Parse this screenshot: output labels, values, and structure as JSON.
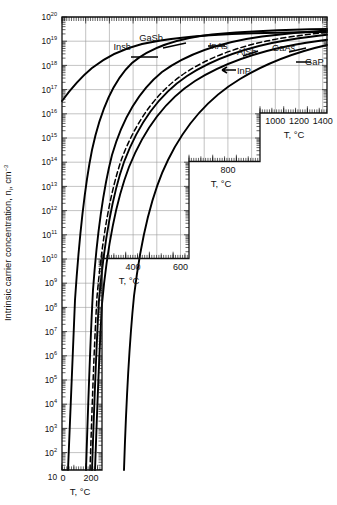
{
  "figure": {
    "kind": "semilog-chart",
    "background": "#ffffff",
    "ink": "#000000",
    "grid_color": "#9a9a9a"
  },
  "axes": {
    "y_title_main": "Intrinsic carrier concentration, n",
    "y_title_sub": "i",
    "y_title_unit": ", cm",
    "y_title_unit_sup": "−3",
    "y_scale": "log",
    "y_labels": [
      {
        "mant": "10",
        "exp": "20"
      },
      {
        "mant": "10",
        "exp": "19"
      },
      {
        "mant": "10",
        "exp": "18"
      },
      {
        "mant": "10",
        "exp": "17"
      },
      {
        "mant": "10",
        "exp": "16"
      },
      {
        "mant": "10",
        "exp": "15"
      },
      {
        "mant": "10",
        "exp": "14"
      },
      {
        "mant": "10",
        "exp": "13"
      },
      {
        "mant": "10",
        "exp": "12"
      },
      {
        "mant": "10",
        "exp": "11"
      },
      {
        "mant": "10",
        "exp": "10"
      },
      {
        "mant": "10",
        "exp": "9"
      },
      {
        "mant": "10",
        "exp": "8"
      },
      {
        "mant": "10",
        "exp": "7"
      },
      {
        "mant": "10",
        "exp": "6"
      },
      {
        "mant": "10",
        "exp": "5"
      },
      {
        "mant": "10",
        "exp": "4"
      },
      {
        "mant": "10",
        "exp": "3"
      },
      {
        "mant": "10",
        "exp": "2"
      },
      {
        "mant": "10",
        "exp": ""
      }
    ],
    "x_axis_title": "T, °C",
    "x_panels": [
      {
        "name": "panel-1000-1400",
        "ticks": [
          "1000",
          "1200",
          "1400"
        ],
        "title": "T, °C"
      },
      {
        "name": "panel-800",
        "ticks": [
          "800"
        ],
        "title": "T, °C"
      },
      {
        "name": "panel-400-600",
        "ticks": [
          "400",
          "600"
        ],
        "title": "T, °C"
      },
      {
        "name": "panel-0-200",
        "ticks": [
          "0",
          "200"
        ],
        "title": "T, °C"
      }
    ]
  },
  "curve_labels": [
    {
      "id": "insb",
      "text": "Insb"
    },
    {
      "id": "gasb",
      "text": "GaSb"
    },
    {
      "id": "inas",
      "text": "InAs"
    },
    {
      "id": "alsb",
      "text": "AlSb"
    },
    {
      "id": "gaas",
      "text": "GaAs"
    },
    {
      "id": "inp",
      "text": "InP"
    },
    {
      "id": "gap",
      "text": "GaP"
    }
  ],
  "chart_data": {
    "type": "line",
    "title": "",
    "xlabel": "T, °C",
    "ylabel": "Intrinsic carrier concentration, n_i, cm^-3",
    "xlim": [
      0,
      1500
    ],
    "ylim": [
      10,
      1e+20
    ],
    "yscale": "log",
    "grid": true,
    "legend": "inline-labels",
    "xticks": [
      0,
      200,
      400,
      600,
      800,
      1000,
      1200,
      1400
    ],
    "yticks": [
      10,
      100,
      1000,
      10000,
      100000,
      1000000,
      10000000,
      100000000,
      1000000000.0,
      10000000000.0,
      100000000000.0,
      1000000000000.0,
      10000000000000.0,
      100000000000000.0,
      1000000000000000.0,
      1e+16,
      1e+17,
      1e+18,
      1e+19,
      1e+20
    ],
    "series": [
      {
        "name": "Insb",
        "style": "solid",
        "points": [
          [
            0,
            14.8
          ],
          [
            20,
            15.6
          ],
          [
            60,
            16.4
          ],
          [
            100,
            16.9
          ],
          [
            150,
            17.3
          ],
          [
            200,
            17.6
          ],
          [
            300,
            18.0
          ],
          [
            400,
            18.3
          ],
          [
            500,
            18.5
          ],
          [
            600,
            18.65
          ],
          [
            700,
            18.75
          ],
          [
            800,
            18.85
          ]
        ]
      },
      {
        "name": "GaSb",
        "style": "solid",
        "points": [
          [
            0,
            11.6
          ],
          [
            50,
            12.9
          ],
          [
            100,
            13.9
          ],
          [
            150,
            14.7
          ],
          [
            200,
            15.4
          ],
          [
            300,
            16.4
          ],
          [
            400,
            17.1
          ],
          [
            500,
            17.6
          ],
          [
            600,
            17.95
          ],
          [
            700,
            18.2
          ],
          [
            800,
            18.4
          ],
          [
            900,
            18.55
          ],
          [
            1000,
            18.65
          ],
          [
            1100,
            18.75
          ]
        ]
      },
      {
        "name": "InAs",
        "style": "solid",
        "points": [
          [
            0,
            9.0
          ],
          [
            50,
            10.8
          ],
          [
            100,
            12.1
          ],
          [
            150,
            13.1
          ],
          [
            200,
            13.9
          ],
          [
            300,
            15.1
          ],
          [
            400,
            15.95
          ],
          [
            500,
            16.6
          ],
          [
            600,
            17.05
          ],
          [
            700,
            17.4
          ],
          [
            800,
            17.7
          ],
          [
            900,
            17.9
          ],
          [
            1000,
            18.1
          ],
          [
            1100,
            18.25
          ],
          [
            1200,
            18.4
          ],
          [
            1300,
            18.5
          ],
          [
            1400,
            18.6
          ]
        ]
      },
      {
        "name": "AlSb",
        "style": "solid",
        "points": [
          [
            100,
            5.4
          ],
          [
            150,
            6.9
          ],
          [
            200,
            8.1
          ],
          [
            300,
            10.0
          ],
          [
            400,
            11.4
          ],
          [
            500,
            12.5
          ],
          [
            600,
            13.4
          ],
          [
            700,
            14.1
          ],
          [
            800,
            14.7
          ],
          [
            900,
            15.2
          ],
          [
            1000,
            15.7
          ],
          [
            1100,
            16.1
          ],
          [
            1200,
            16.5
          ],
          [
            1300,
            16.8
          ],
          [
            1400,
            17.1
          ]
        ]
      },
      {
        "name": "InP",
        "style": "dashed",
        "points": [
          [
            100,
            5.6
          ],
          [
            150,
            7.1
          ],
          [
            200,
            8.3
          ],
          [
            300,
            10.2
          ],
          [
            400,
            11.6
          ],
          [
            500,
            12.7
          ],
          [
            600,
            13.6
          ],
          [
            700,
            14.3
          ],
          [
            800,
            14.9
          ],
          [
            900,
            15.4
          ],
          [
            1000,
            15.85
          ],
          [
            1100,
            16.25
          ],
          [
            1200,
            16.6
          ],
          [
            1300,
            16.9
          ],
          [
            1400,
            17.2
          ]
        ]
      },
      {
        "name": "GaAs",
        "style": "solid",
        "points": [
          [
            100,
            5.2
          ],
          [
            150,
            6.7
          ],
          [
            200,
            7.9
          ],
          [
            300,
            9.8
          ],
          [
            400,
            11.2
          ],
          [
            500,
            12.3
          ],
          [
            600,
            13.2
          ],
          [
            700,
            13.95
          ],
          [
            800,
            14.55
          ],
          [
            900,
            15.1
          ],
          [
            1000,
            15.55
          ],
          [
            1100,
            15.95
          ],
          [
            1200,
            16.3
          ],
          [
            1300,
            16.6
          ],
          [
            1400,
            16.9
          ]
        ]
      },
      {
        "name": "GaP",
        "style": "solid",
        "points": [
          [
            150,
            1.2
          ],
          [
            200,
            2.6
          ],
          [
            300,
            5.0
          ],
          [
            400,
            6.9
          ],
          [
            500,
            8.4
          ],
          [
            600,
            9.7
          ],
          [
            700,
            10.8
          ],
          [
            800,
            11.7
          ],
          [
            900,
            12.5
          ],
          [
            1000,
            13.2
          ],
          [
            1100,
            13.8
          ],
          [
            1200,
            14.3
          ],
          [
            1300,
            14.8
          ],
          [
            1400,
            15.2
          ]
        ]
      }
    ]
  }
}
